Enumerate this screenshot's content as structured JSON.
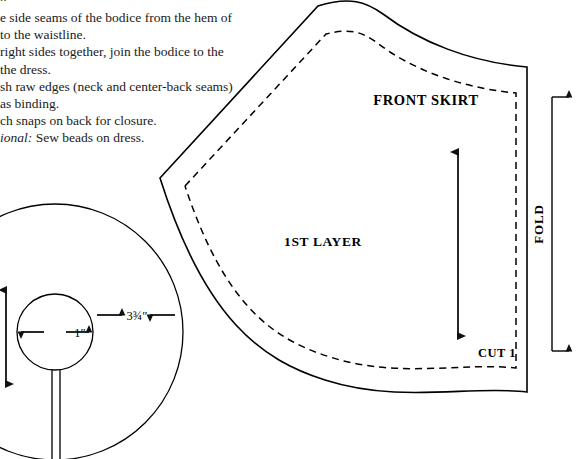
{
  "page": {
    "width": 585,
    "height": 459,
    "background_color": "#ffffff",
    "ink_color": "#000000"
  },
  "instructions": {
    "note": "Left-margin-clipped instruction text from a sewing pattern page",
    "lines": [
      {
        "id": "line0",
        "text": "g.",
        "clipped_left": true,
        "clipped_top": true,
        "italic": false
      },
      {
        "id": "line1",
        "text": "e side seams of the bodice from the hem of",
        "clipped_left": true,
        "italic": false
      },
      {
        "id": "line2",
        "text": "to the waistline.",
        "clipped_left": true,
        "italic": false
      },
      {
        "id": "line3",
        "text": "right sides together, join the bodice to the",
        "clipped_left": true,
        "italic": false
      },
      {
        "id": "line4",
        "text": "the dress.",
        "clipped_left": true,
        "italic": false
      },
      {
        "id": "line5",
        "text": "sh raw edges (neck and center-back seams)",
        "clipped_left": true,
        "italic": false
      },
      {
        "id": "line6",
        "text": "as binding.",
        "clipped_left": true,
        "italic": false
      },
      {
        "id": "line7",
        "text": "ch snaps on back for closure.",
        "clipped_left": true,
        "italic": false
      },
      {
        "id": "line8",
        "italic_prefix": "ional:",
        "text": " Sew beads on dress.",
        "clipped_left": true,
        "italic": true
      }
    ]
  },
  "skirt_piece": {
    "name": "front-skirt-pattern-piece",
    "title": "FRONT SKIRT",
    "layer_label": "1ST LAYER",
    "cut_label": "CUT 1",
    "fold_label": "FOLD",
    "outline_style": "solid",
    "seam_line_style": "dashed",
    "grainline": {
      "name": "grainline-arrow",
      "type": "double-headed-vertical-arrow",
      "x": 458,
      "y_top": 148,
      "y_bottom": 340
    },
    "fold_bracket": {
      "name": "fold-bracket",
      "type": "double-arrow-bracket",
      "x_spine": 552,
      "y_top": 93,
      "y_bottom": 355,
      "arrow_direction": "right"
    }
  },
  "circle_piece": {
    "name": "circular-skirt-pattern-piece",
    "shape": "annulus-with-slit",
    "outer_radius_px": 128,
    "inner_radius_px": 38,
    "center": {
      "x": 55,
      "y": 332
    },
    "inner_diameter_label": "1″",
    "ring_width_label": "3¾″",
    "slit": {
      "name": "circle-slit",
      "description": "vertical slit from inner circle downward through outer edge"
    },
    "dimension_arrows": [
      {
        "name": "inner-diameter-arrow",
        "label": "1″",
        "type": "double-headed-horizontal-arrow",
        "orientation": "horizontal"
      },
      {
        "name": "ring-width-arrow",
        "label": "3¾″",
        "type": "double-headed-horizontal-arrow",
        "orientation": "horizontal"
      },
      {
        "name": "outer-height-arrow",
        "label": "",
        "type": "double-headed-vertical-arrow",
        "orientation": "vertical",
        "clipped_left": true
      }
    ]
  }
}
